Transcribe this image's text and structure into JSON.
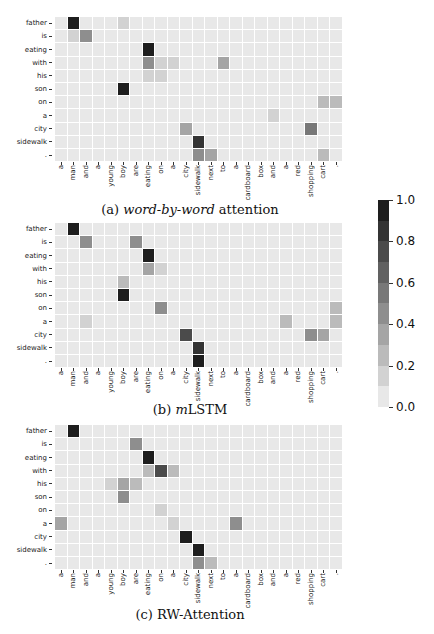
{
  "chart_data": [
    {
      "type": "heatmap",
      "title": "(a) word-by-word attention",
      "caption_prefix": "(a) ",
      "caption_italic": "word-by-word",
      "caption_suffix": " attention",
      "x": [
        "a",
        "man",
        "and",
        "a",
        "young",
        "boy",
        "are",
        "eating",
        "on",
        "a",
        "city",
        "sidewalk",
        "next",
        "to",
        "a",
        "cardboard",
        "box",
        "and",
        "a",
        "red",
        "shopping",
        "cart",
        "."
      ],
      "y": [
        "father",
        "is",
        "eating",
        "with",
        "his",
        "son",
        "on",
        "a",
        "city",
        "sidewalk",
        "."
      ],
      "values": [
        [
          0.03,
          0.92,
          0.03,
          0.03,
          0.03,
          0.18,
          0.04,
          0.05,
          0.04,
          0.04,
          0.04,
          0.04,
          0.04,
          0.04,
          0.04,
          0.04,
          0.04,
          0.04,
          0.04,
          0.04,
          0.04,
          0.04,
          0.04
        ],
        [
          0.03,
          0.18,
          0.45,
          0.04,
          0.04,
          0.04,
          0.04,
          0.05,
          0.04,
          0.04,
          0.04,
          0.04,
          0.04,
          0.04,
          0.04,
          0.04,
          0.04,
          0.04,
          0.04,
          0.04,
          0.04,
          0.04,
          0.04
        ],
        [
          0.03,
          0.04,
          0.04,
          0.04,
          0.04,
          0.04,
          0.04,
          0.95,
          0.04,
          0.04,
          0.04,
          0.04,
          0.04,
          0.04,
          0.04,
          0.04,
          0.04,
          0.04,
          0.04,
          0.04,
          0.04,
          0.04,
          0.04
        ],
        [
          0.03,
          0.04,
          0.04,
          0.04,
          0.04,
          0.04,
          0.04,
          0.45,
          0.18,
          0.16,
          0.04,
          0.04,
          0.04,
          0.35,
          0.04,
          0.04,
          0.04,
          0.04,
          0.04,
          0.04,
          0.04,
          0.04,
          0.04
        ],
        [
          0.03,
          0.04,
          0.04,
          0.04,
          0.04,
          0.04,
          0.04,
          0.18,
          0.18,
          0.05,
          0.04,
          0.04,
          0.04,
          0.04,
          0.04,
          0.04,
          0.04,
          0.04,
          0.04,
          0.04,
          0.04,
          0.04,
          0.04
        ],
        [
          0.03,
          0.04,
          0.04,
          0.04,
          0.04,
          0.95,
          0.04,
          0.05,
          0.04,
          0.04,
          0.04,
          0.04,
          0.04,
          0.04,
          0.04,
          0.04,
          0.04,
          0.04,
          0.04,
          0.04,
          0.04,
          0.04,
          0.04
        ],
        [
          0.03,
          0.04,
          0.04,
          0.04,
          0.04,
          0.04,
          0.04,
          0.04,
          0.04,
          0.04,
          0.04,
          0.04,
          0.04,
          0.04,
          0.04,
          0.04,
          0.04,
          0.04,
          0.04,
          0.04,
          0.04,
          0.22,
          0.22
        ],
        [
          0.03,
          0.04,
          0.04,
          0.04,
          0.04,
          0.04,
          0.04,
          0.04,
          0.04,
          0.04,
          0.04,
          0.04,
          0.04,
          0.04,
          0.04,
          0.04,
          0.04,
          0.18,
          0.04,
          0.04,
          0.04,
          0.04,
          0.04
        ],
        [
          0.03,
          0.04,
          0.04,
          0.04,
          0.04,
          0.04,
          0.04,
          0.04,
          0.04,
          0.04,
          0.35,
          0.04,
          0.04,
          0.04,
          0.04,
          0.04,
          0.04,
          0.04,
          0.04,
          0.04,
          0.5,
          0.04,
          0.04
        ],
        [
          0.03,
          0.04,
          0.04,
          0.04,
          0.04,
          0.04,
          0.04,
          0.04,
          0.04,
          0.04,
          0.04,
          0.85,
          0.04,
          0.04,
          0.04,
          0.04,
          0.04,
          0.04,
          0.04,
          0.04,
          0.04,
          0.04,
          0.04
        ],
        [
          0.03,
          0.04,
          0.04,
          0.04,
          0.04,
          0.04,
          0.04,
          0.04,
          0.04,
          0.04,
          0.04,
          0.45,
          0.3,
          0.04,
          0.04,
          0.04,
          0.04,
          0.04,
          0.04,
          0.04,
          0.04,
          0.25,
          0.04
        ]
      ]
    },
    {
      "type": "heatmap",
      "title": "(b) mLSTM",
      "caption_prefix": "(b) ",
      "caption_italic": "m",
      "caption_suffix": "LSTM",
      "x": [
        "a",
        "man",
        "and",
        "a",
        "young",
        "boy",
        "are",
        "eating",
        "on",
        "a",
        "city",
        "sidewalk",
        "next",
        "to",
        "a",
        "cardboard",
        "box",
        "and",
        "a",
        "red",
        "shopping",
        "cart",
        "."
      ],
      "y": [
        "father",
        "is",
        "eating",
        "with",
        "his",
        "son",
        "on",
        "a",
        "city",
        "sidewalk",
        "."
      ],
      "values": [
        [
          0.03,
          0.95,
          0.04,
          0.04,
          0.04,
          0.04,
          0.04,
          0.04,
          0.04,
          0.04,
          0.04,
          0.04,
          0.04,
          0.04,
          0.04,
          0.04,
          0.04,
          0.04,
          0.04,
          0.04,
          0.04,
          0.04,
          0.04
        ],
        [
          0.03,
          0.04,
          0.45,
          0.04,
          0.04,
          0.04,
          0.4,
          0.04,
          0.04,
          0.04,
          0.04,
          0.04,
          0.04,
          0.04,
          0.04,
          0.04,
          0.04,
          0.04,
          0.04,
          0.04,
          0.04,
          0.04,
          0.04
        ],
        [
          0.03,
          0.04,
          0.04,
          0.04,
          0.04,
          0.04,
          0.04,
          0.95,
          0.04,
          0.04,
          0.04,
          0.04,
          0.04,
          0.04,
          0.04,
          0.04,
          0.04,
          0.04,
          0.04,
          0.04,
          0.04,
          0.04,
          0.04
        ],
        [
          0.03,
          0.04,
          0.04,
          0.04,
          0.04,
          0.04,
          0.04,
          0.3,
          0.18,
          0.04,
          0.04,
          0.04,
          0.04,
          0.04,
          0.04,
          0.04,
          0.04,
          0.04,
          0.04,
          0.04,
          0.04,
          0.04,
          0.04
        ],
        [
          0.03,
          0.04,
          0.04,
          0.04,
          0.04,
          0.2,
          0.04,
          0.04,
          0.04,
          0.04,
          0.04,
          0.04,
          0.04,
          0.04,
          0.04,
          0.04,
          0.04,
          0.04,
          0.04,
          0.04,
          0.04,
          0.04,
          0.04
        ],
        [
          0.03,
          0.04,
          0.04,
          0.04,
          0.04,
          0.95,
          0.04,
          0.04,
          0.04,
          0.04,
          0.04,
          0.04,
          0.04,
          0.04,
          0.04,
          0.04,
          0.04,
          0.04,
          0.04,
          0.04,
          0.04,
          0.04,
          0.04
        ],
        [
          0.03,
          0.04,
          0.04,
          0.04,
          0.04,
          0.04,
          0.04,
          0.04,
          0.4,
          0.04,
          0.04,
          0.04,
          0.04,
          0.04,
          0.04,
          0.04,
          0.04,
          0.04,
          0.04,
          0.04,
          0.04,
          0.04,
          0.25
        ],
        [
          0.03,
          0.04,
          0.18,
          0.04,
          0.04,
          0.04,
          0.04,
          0.04,
          0.04,
          0.04,
          0.04,
          0.04,
          0.04,
          0.04,
          0.04,
          0.04,
          0.04,
          0.04,
          0.2,
          0.04,
          0.04,
          0.04,
          0.25
        ],
        [
          0.03,
          0.04,
          0.04,
          0.04,
          0.04,
          0.04,
          0.04,
          0.04,
          0.04,
          0.04,
          0.75,
          0.04,
          0.04,
          0.04,
          0.04,
          0.04,
          0.04,
          0.04,
          0.04,
          0.04,
          0.45,
          0.3,
          0.04
        ],
        [
          0.03,
          0.04,
          0.04,
          0.04,
          0.04,
          0.04,
          0.04,
          0.04,
          0.04,
          0.04,
          0.04,
          0.85,
          0.04,
          0.04,
          0.04,
          0.04,
          0.04,
          0.04,
          0.04,
          0.04,
          0.04,
          0.04,
          0.04
        ],
        [
          0.03,
          0.04,
          0.04,
          0.04,
          0.04,
          0.04,
          0.04,
          0.04,
          0.04,
          0.04,
          0.04,
          0.9,
          0.04,
          0.04,
          0.04,
          0.04,
          0.04,
          0.04,
          0.04,
          0.04,
          0.04,
          0.04,
          0.04
        ]
      ]
    },
    {
      "type": "heatmap",
      "title": "(c) RW-Attention",
      "caption_prefix": "(c) RW-Attention",
      "caption_italic": "",
      "caption_suffix": "",
      "x": [
        "a",
        "man",
        "and",
        "a",
        "young",
        "boy",
        "are",
        "eating",
        "on",
        "a",
        "city",
        "sidewalk",
        "next",
        "to",
        "a",
        "cardboard",
        "box",
        "and",
        "a",
        "red",
        "shopping",
        "cart",
        "."
      ],
      "y": [
        "father",
        "is",
        "eating",
        "with",
        "his",
        "son",
        "on",
        "a",
        "city",
        "sidewalk",
        "."
      ],
      "values": [
        [
          0.03,
          0.95,
          0.04,
          0.04,
          0.04,
          0.04,
          0.04,
          0.04,
          0.04,
          0.04,
          0.04,
          0.04,
          0.04,
          0.04,
          0.04,
          0.04,
          0.04,
          0.04,
          0.04,
          0.04,
          0.04,
          0.04,
          0.04
        ],
        [
          0.03,
          0.04,
          0.04,
          0.04,
          0.04,
          0.04,
          0.4,
          0.04,
          0.04,
          0.04,
          0.04,
          0.04,
          0.04,
          0.04,
          0.04,
          0.04,
          0.04,
          0.04,
          0.04,
          0.04,
          0.04,
          0.04,
          0.04
        ],
        [
          0.03,
          0.04,
          0.04,
          0.04,
          0.04,
          0.04,
          0.04,
          0.95,
          0.04,
          0.04,
          0.04,
          0.04,
          0.04,
          0.04,
          0.04,
          0.04,
          0.04,
          0.04,
          0.04,
          0.04,
          0.04,
          0.04,
          0.04
        ],
        [
          0.03,
          0.04,
          0.04,
          0.04,
          0.04,
          0.04,
          0.04,
          0.25,
          0.7,
          0.2,
          0.04,
          0.04,
          0.04,
          0.04,
          0.04,
          0.04,
          0.04,
          0.04,
          0.04,
          0.04,
          0.04,
          0.04,
          0.04
        ],
        [
          0.03,
          0.04,
          0.04,
          0.04,
          0.18,
          0.3,
          0.2,
          0.04,
          0.04,
          0.04,
          0.04,
          0.04,
          0.04,
          0.04,
          0.04,
          0.04,
          0.04,
          0.04,
          0.04,
          0.04,
          0.04,
          0.04,
          0.04
        ],
        [
          0.03,
          0.04,
          0.04,
          0.04,
          0.04,
          0.4,
          0.04,
          0.04,
          0.04,
          0.04,
          0.04,
          0.04,
          0.04,
          0.04,
          0.04,
          0.04,
          0.04,
          0.04,
          0.04,
          0.04,
          0.04,
          0.04,
          0.04
        ],
        [
          0.03,
          0.04,
          0.04,
          0.04,
          0.04,
          0.04,
          0.04,
          0.04,
          0.18,
          0.04,
          0.04,
          0.04,
          0.04,
          0.04,
          0.04,
          0.04,
          0.04,
          0.04,
          0.04,
          0.04,
          0.04,
          0.04,
          0.04
        ],
        [
          0.3,
          0.04,
          0.04,
          0.04,
          0.04,
          0.04,
          0.04,
          0.04,
          0.04,
          0.18,
          0.04,
          0.04,
          0.04,
          0.04,
          0.4,
          0.04,
          0.04,
          0.04,
          0.04,
          0.04,
          0.04,
          0.04,
          0.04
        ],
        [
          0.03,
          0.04,
          0.04,
          0.04,
          0.04,
          0.04,
          0.04,
          0.04,
          0.04,
          0.04,
          0.95,
          0.04,
          0.04,
          0.04,
          0.04,
          0.04,
          0.04,
          0.04,
          0.04,
          0.04,
          0.04,
          0.04,
          0.04
        ],
        [
          0.03,
          0.04,
          0.04,
          0.04,
          0.04,
          0.04,
          0.04,
          0.04,
          0.04,
          0.04,
          0.04,
          0.95,
          0.04,
          0.04,
          0.04,
          0.04,
          0.04,
          0.04,
          0.04,
          0.04,
          0.04,
          0.04,
          0.04
        ],
        [
          0.03,
          0.04,
          0.04,
          0.04,
          0.04,
          0.04,
          0.04,
          0.04,
          0.04,
          0.04,
          0.04,
          0.4,
          0.2,
          0.04,
          0.04,
          0.04,
          0.04,
          0.04,
          0.04,
          0.04,
          0.04,
          0.04,
          0.04
        ]
      ]
    }
  ],
  "colorbar": {
    "min": 0.0,
    "max": 1.0,
    "ticks": [
      "1.0",
      "0.8",
      "0.6",
      "0.4",
      "0.2",
      "0.0"
    ],
    "levels": 10,
    "color_low": "#e8e8e8",
    "color_high": "#1e1e1e"
  },
  "layout": {
    "panel_grid_tops": [
      17,
      223,
      425
    ],
    "panel_caption_tops": [
      202,
      402,
      607
    ]
  }
}
